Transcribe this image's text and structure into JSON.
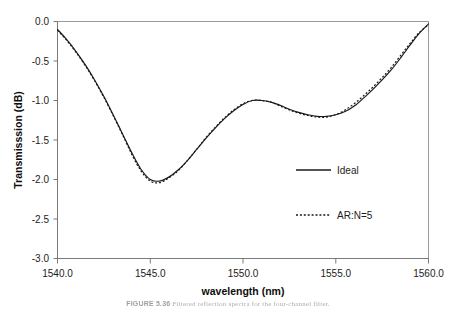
{
  "chart_data": {
    "type": "line",
    "title": "",
    "xlabel": "wavelength (nm)",
    "ylabel": "Transmisssion (dB)",
    "xlim": [
      1540.0,
      1560.0
    ],
    "ylim": [
      -3.0,
      0.0
    ],
    "grid": false,
    "legend_position": "right-inside",
    "xticks": [
      "1540.0",
      "1545.0",
      "1550.0",
      "1555.0",
      "1560.0"
    ],
    "xtick_values": [
      1540.0,
      1545.0,
      1550.0,
      1555.0,
      1560.0
    ],
    "yticks": [
      "0.0",
      "-0.5",
      "-1.0",
      "-1.5",
      "-2.0",
      "-2.5",
      "-3.0"
    ],
    "ytick_values": [
      0.0,
      -0.5,
      -1.0,
      -1.5,
      -2.0,
      -2.5,
      -3.0
    ],
    "x": [
      1540.0,
      1540.5,
      1541.0,
      1541.5,
      1542.0,
      1542.5,
      1543.0,
      1543.5,
      1544.0,
      1544.5,
      1545.0,
      1545.5,
      1546.0,
      1546.5,
      1547.0,
      1547.5,
      1548.0,
      1548.5,
      1549.0,
      1549.5,
      1550.0,
      1550.5,
      1551.0,
      1551.5,
      1552.0,
      1552.5,
      1553.0,
      1553.5,
      1554.0,
      1554.5,
      1555.0,
      1555.5,
      1556.0,
      1556.5,
      1557.0,
      1557.5,
      1558.0,
      1558.5,
      1559.0,
      1559.5,
      1560.0
    ],
    "series": [
      {
        "name": "Ideal",
        "style": "solid",
        "color": "#1a1a1a",
        "values": [
          -0.1,
          -0.23,
          -0.38,
          -0.55,
          -0.74,
          -0.95,
          -1.18,
          -1.42,
          -1.66,
          -1.87,
          -2.0,
          -2.02,
          -1.97,
          -1.88,
          -1.76,
          -1.62,
          -1.48,
          -1.35,
          -1.23,
          -1.13,
          -1.05,
          -1.0,
          -1.0,
          -1.02,
          -1.06,
          -1.11,
          -1.15,
          -1.18,
          -1.2,
          -1.2,
          -1.18,
          -1.14,
          -1.07,
          -0.97,
          -0.86,
          -0.74,
          -0.61,
          -0.46,
          -0.3,
          -0.15,
          -0.03
        ]
      },
      {
        "name": "AR:N=5",
        "style": "dotted",
        "color": "#1a1a1a",
        "values": [
          -0.11,
          -0.24,
          -0.39,
          -0.56,
          -0.75,
          -0.96,
          -1.19,
          -1.43,
          -1.68,
          -1.89,
          -2.02,
          -2.04,
          -1.98,
          -1.89,
          -1.76,
          -1.62,
          -1.47,
          -1.34,
          -1.22,
          -1.12,
          -1.04,
          -1.0,
          -1.0,
          -1.02,
          -1.07,
          -1.12,
          -1.16,
          -1.19,
          -1.21,
          -1.21,
          -1.18,
          -1.12,
          -1.04,
          -0.94,
          -0.83,
          -0.71,
          -0.58,
          -0.43,
          -0.28,
          -0.14,
          -0.04
        ]
      }
    ],
    "annotations": {
      "minimum": {
        "x": 1544.5,
        "y": -2.02
      },
      "local_maximum": {
        "x": 1550.7,
        "y": -1.0
      },
      "secondary_minimum": {
        "x": 1554.2,
        "y": -1.2
      }
    }
  },
  "legend": {
    "entries": [
      {
        "label": "Ideal",
        "style": "solid"
      },
      {
        "label": "AR:N=5",
        "style": "dotted"
      }
    ]
  },
  "caption": {
    "number": "FIGURE 5.36",
    "text": "Filtered reflection spectra for the four-channel filter."
  }
}
